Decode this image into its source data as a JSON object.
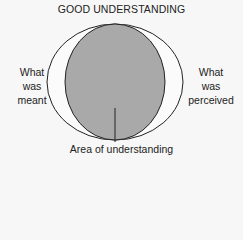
{
  "diagram": {
    "title": "GOOD UNDERSTANDING",
    "left_label": [
      "What",
      "was",
      "meant"
    ],
    "right_label": [
      "What",
      "was",
      "perceived"
    ],
    "bottom_label": "Area of understanding",
    "colors": {
      "fill": "#a9a9a9",
      "stroke": "#222222",
      "background": "#f7f7f7"
    }
  }
}
